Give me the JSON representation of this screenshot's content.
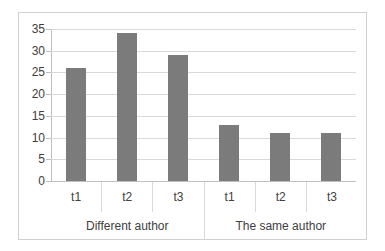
{
  "chart_data": {
    "type": "bar",
    "title": "",
    "subtitle": "",
    "xlabel": "",
    "ylabel": "",
    "ylim": [
      0,
      35
    ],
    "y_ticks": [
      0,
      5,
      10,
      15,
      20,
      25,
      30,
      35
    ],
    "grid": true,
    "legend": "none",
    "categories": [
      "t1",
      "t2",
      "t3",
      "t1",
      "t2",
      "t3"
    ],
    "values": [
      26,
      34,
      29,
      13,
      11,
      11
    ],
    "groups": [
      {
        "label": "Different author",
        "categories": [
          "t1",
          "t2",
          "t3"
        ],
        "values": [
          26,
          34,
          29
        ]
      },
      {
        "label": "The same author",
        "categories": [
          "t1",
          "t2",
          "t3"
        ],
        "values": [
          13,
          11,
          11
        ]
      }
    ],
    "series": [
      {
        "name": "count",
        "values": [
          26,
          34,
          29,
          13,
          11,
          11
        ]
      }
    ],
    "colors": {
      "bar": "#7b7b7b",
      "gridline": "#d9d9d9",
      "axis": "#bfbfbf",
      "text": "#404040",
      "frame": "#d0d0d0",
      "background": "#ffffff"
    }
  }
}
